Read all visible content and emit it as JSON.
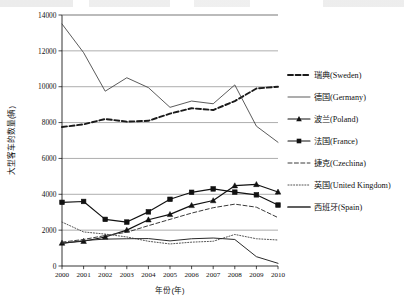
{
  "chart_data": {
    "type": "line",
    "title": "",
    "xlabel": "年份(年)",
    "ylabel": "大型客车的数量(辆)",
    "xlim": [
      2000,
      2010
    ],
    "ylim": [
      0,
      14000
    ],
    "ytick_step": 2000,
    "grid": "horizontal",
    "legend_position": "right",
    "categories": [
      "2000",
      "2001",
      "2002",
      "2003",
      "2004",
      "2005",
      "2006",
      "2007",
      "2008",
      "2009",
      "2010"
    ],
    "x": [
      2000,
      2001,
      2002,
      2003,
      2004,
      2005,
      2006,
      2007,
      2008,
      2009,
      2010
    ],
    "yticks": [
      "0",
      "2000",
      "4000",
      "6000",
      "8000",
      "10000",
      "12000",
      "14000"
    ],
    "series": [
      {
        "name": "瑞典(Sweden)",
        "style": "dashed-thick",
        "marker": "none",
        "color": "#1a1a1a",
        "values": [
          7750,
          7900,
          8200,
          8050,
          8100,
          8500,
          8800,
          8700,
          9200,
          9900,
          10000
        ]
      },
      {
        "name": "德国(Germany)",
        "style": "solid-thin",
        "marker": "none",
        "color": "#3d3d3d",
        "values": [
          13500,
          11900,
          9750,
          10500,
          9950,
          8850,
          9200,
          9050,
          10100,
          7800,
          6900
        ]
      },
      {
        "name": "波兰(Poland)",
        "style": "solid-marker",
        "marker": "triangle",
        "color": "#111111",
        "values": [
          1280,
          1380,
          1620,
          2000,
          2580,
          2880,
          3380,
          3650,
          4480,
          4550,
          4130
        ]
      },
      {
        "name": "法国(France)",
        "style": "solid-marker",
        "marker": "square",
        "color": "#111111",
        "values": [
          3550,
          3600,
          2600,
          2450,
          3020,
          3720,
          4110,
          4300,
          4120,
          3970,
          3400
        ]
      },
      {
        "name": "捷克(Czechina)",
        "style": "dashed-thin",
        "marker": "none",
        "color": "#3a3a3a",
        "values": [
          1330,
          1480,
          1700,
          1880,
          2250,
          2600,
          2950,
          3250,
          3450,
          3280,
          2700
        ]
      },
      {
        "name": "英国(United Kingdom)",
        "style": "dotted",
        "marker": "none",
        "color": "#555555",
        "values": [
          2450,
          1900,
          1780,
          1620,
          1380,
          1230,
          1330,
          1380,
          1760,
          1520,
          1450
        ]
      },
      {
        "name": "西班牙(Spain)",
        "style": "solid-thin2",
        "marker": "none",
        "color": "#2a2a2a",
        "values": [
          1250,
          1420,
          1500,
          1520,
          1530,
          1400,
          1520,
          1560,
          1480,
          520,
          150
        ]
      }
    ]
  },
  "legend": {
    "items": [
      {
        "label": "瑞典(Sweden)",
        "swatch": "dashed-thick-swatch"
      },
      {
        "label": "德国(Germany)",
        "swatch": "solid-thin-swatch"
      },
      {
        "label": "波兰(Poland)",
        "swatch": "triangle-marker-swatch"
      },
      {
        "label": "法国(France)",
        "swatch": "square-marker-swatch"
      },
      {
        "label": "捷克(Czechina)",
        "swatch": "dashed-thin-swatch"
      },
      {
        "label": "英国(United Kingdom)",
        "swatch": "dotted-swatch"
      },
      {
        "label": "西班牙(Spain)",
        "swatch": "solid-thick-swatch"
      }
    ]
  }
}
